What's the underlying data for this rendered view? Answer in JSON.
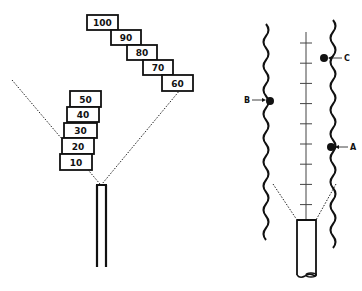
{
  "left_figure": {
    "boxes": [
      {
        "label": "100",
        "x": 87,
        "y": 15,
        "w": 31,
        "h": 15
      },
      {
        "label": "90",
        "x": 111,
        "y": 30,
        "w": 30,
        "h": 15
      },
      {
        "label": "80",
        "x": 127,
        "y": 45,
        "w": 30,
        "h": 15
      },
      {
        "label": "70",
        "x": 143,
        "y": 60,
        "w": 30,
        "h": 15
      },
      {
        "label": "60",
        "x": 162,
        "y": 75,
        "w": 31,
        "h": 16
      },
      {
        "label": "50",
        "x": 70,
        "y": 91,
        "w": 31,
        "h": 16
      },
      {
        "label": "40",
        "x": 67,
        "y": 107,
        "w": 32,
        "h": 15
      },
      {
        "label": "30",
        "x": 64,
        "y": 123,
        "w": 33,
        "h": 15
      },
      {
        "label": "20",
        "x": 62,
        "y": 138,
        "w": 32,
        "h": 16
      },
      {
        "label": "10",
        "x": 60,
        "y": 154,
        "w": 32,
        "h": 16
      }
    ]
  },
  "right_figure": {
    "axis_ticks": 9,
    "points": [
      {
        "label": "A"
      },
      {
        "label": "B"
      },
      {
        "label": "C"
      }
    ]
  }
}
